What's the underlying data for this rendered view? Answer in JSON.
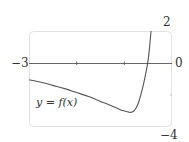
{
  "chart_data": {
    "type": "line",
    "title": "",
    "xlabel": "",
    "ylabel": "",
    "xlim": [
      -3,
      0
    ],
    "ylim": [
      -4,
      2
    ],
    "x_ticks": [
      -3,
      -2,
      -1,
      0
    ],
    "tick_labels": {
      "x_min": "−3",
      "x_max": "0",
      "y_max": "2",
      "y_min": "−4"
    },
    "grid": false,
    "legend": null,
    "annotations": [
      "y = f(x)"
    ],
    "series": [
      {
        "name": "y = f(x)",
        "x": [
          -3.0,
          -2.75,
          -2.5,
          -2.25,
          -2.0,
          -1.75,
          -1.5,
          -1.25,
          -1.1,
          -1.0,
          -0.9,
          -0.85,
          -0.8,
          -0.75,
          -0.7,
          -0.65,
          -0.6,
          -0.55,
          -0.5,
          -0.47,
          -0.44
        ],
        "y": [
          -1.05,
          -1.2,
          -1.4,
          -1.6,
          -1.85,
          -2.1,
          -2.4,
          -2.7,
          -2.9,
          -3.0,
          -3.08,
          -3.08,
          -3.0,
          -2.8,
          -2.45,
          -1.95,
          -1.35,
          -0.65,
          0.2,
          1.0,
          2.0
        ]
      }
    ]
  }
}
